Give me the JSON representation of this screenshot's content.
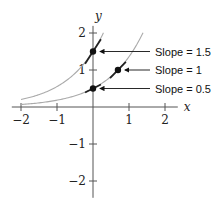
{
  "chart_data": {
    "type": "line",
    "title": "",
    "xlabel": "x",
    "ylabel": "y",
    "xlim": [
      -2.2,
      2.3
    ],
    "ylim": [
      -2.4,
      2.3
    ],
    "x_ticks": [
      -2,
      -1,
      1,
      2
    ],
    "y_ticks": [
      -2,
      -1,
      1,
      2
    ],
    "x_tick_labels": [
      "−2",
      "−1",
      "1",
      "2"
    ],
    "y_tick_labels": [
      "−2",
      "−1",
      "1",
      "2"
    ],
    "grid": false,
    "series": [
      {
        "name": "upper curve (y = 1.5e^x)",
        "k": 1.5,
        "x_range": [
          -2,
          0.29
        ],
        "color": "#aaaaaa"
      },
      {
        "name": "lower curve (y = 0.5e^x)",
        "k": 0.5,
        "x_range": [
          -2,
          1.39
        ],
        "color": "#aaaaaa"
      }
    ],
    "points": [
      {
        "x": 0,
        "y": 1.5,
        "slope": 1.5,
        "label": "Slope = 1.5"
      },
      {
        "x": 0.693,
        "y": 1,
        "slope": 1,
        "label": "Slope = 1"
      },
      {
        "x": 0,
        "y": 0.5,
        "slope": 0.5,
        "label": "Slope = 0.5"
      }
    ],
    "annotations": [
      "Slope = 1.5",
      "Slope = 1",
      "Slope = 0.5"
    ]
  },
  "layout": {
    "origin_px": [
      93,
      107
    ],
    "x_scale": 36,
    "y_scale": 37
  }
}
